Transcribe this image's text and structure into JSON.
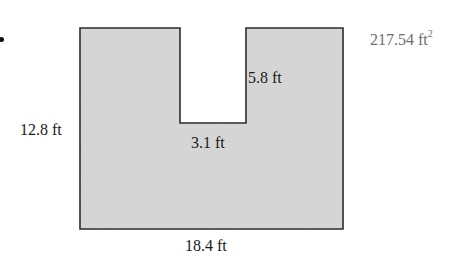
{
  "figure": {
    "shape": "rectangle-with-top-notch",
    "fill_color": "#d6d6d6",
    "stroke_color": "#2a2a2a",
    "dimensions": {
      "height_label": "12.8 ft",
      "width_label": "18.4 ft",
      "notch_depth_label": "5.8 ft",
      "notch_width_label": "3.1 ft"
    }
  },
  "answer": {
    "value": "217.54 ft",
    "exponent": "2"
  }
}
